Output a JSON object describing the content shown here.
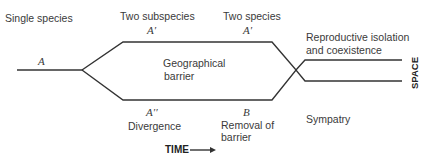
{
  "diagram": {
    "type": "allopatric-speciation",
    "labels": {
      "single_species": "Single species",
      "two_subspecies": "Two subspecies",
      "two_species": "Two species",
      "reproductive_isolation": [
        "Reproductive isolation",
        "and coexistence"
      ],
      "geographical_barrier": [
        "Geographical",
        "barrier"
      ],
      "divergence": "Divergence",
      "removal_of_barrier": [
        "Removal of",
        "barrier"
      ],
      "sympatry": "Sympatry"
    },
    "symbols": {
      "a": "A",
      "a_prime_1": "A′",
      "a_prime_2": "A′",
      "a_double_prime": "A′′",
      "b": "B"
    },
    "axes": {
      "time": "TIME",
      "space": "SPACE"
    },
    "line_color": "#333333"
  }
}
